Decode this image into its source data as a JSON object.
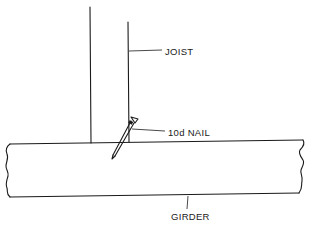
{
  "diagram": {
    "type": "construction-detail",
    "labels": {
      "joist": "JOIST",
      "nail": "10d NAIL",
      "girder": "GIRDER"
    },
    "colors": {
      "ink": "#1a1a1a",
      "background": "#ffffff"
    }
  }
}
